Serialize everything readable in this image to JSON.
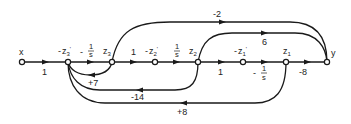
{
  "diagram": {
    "type": "signal-flow-graph",
    "nodes": [
      {
        "id": "x",
        "label": "x",
        "cx": 22,
        "cy": 62
      },
      {
        "id": "n_z3p",
        "label": "-z3'",
        "cx": 68,
        "cy": 62
      },
      {
        "id": "n_z3",
        "label": "z3",
        "cx": 112,
        "cy": 62
      },
      {
        "id": "n_z2p",
        "label": "-z2'",
        "cx": 155,
        "cy": 62
      },
      {
        "id": "n_z2",
        "label": "z2",
        "cx": 198,
        "cy": 62
      },
      {
        "id": "n_z1p",
        "label": "-z1'",
        "cx": 243,
        "cy": 62
      },
      {
        "id": "n_z1",
        "label": "z1",
        "cx": 286,
        "cy": 62
      },
      {
        "id": "y",
        "label": "y",
        "cx": 327,
        "cy": 62
      }
    ],
    "node_labels": {
      "x": "x",
      "z3p_minus": "-",
      "z3p": "z",
      "z3p_sub": "3",
      "z3p_prime": "'",
      "z3": "z",
      "z3_sub": "3",
      "z2p_minus": "-",
      "z2p": "z",
      "z2p_sub": "2",
      "z2p_prime": "'",
      "z2": "z",
      "z2_sub": "2",
      "z1p_minus": "-",
      "z1p": "z",
      "z1p_sub": "1",
      "z1p_prime": "'",
      "z1": "z",
      "z1_sub": "1",
      "y": "y"
    },
    "edges": [
      {
        "from": "x",
        "to": "-z3'",
        "gain": "1"
      },
      {
        "from": "-z3'",
        "to": "z3",
        "gain": "-1/s"
      },
      {
        "from": "z3",
        "to": "-z2'",
        "gain": "1"
      },
      {
        "from": "-z2'",
        "to": "z2",
        "gain": "1/s"
      },
      {
        "from": "z2",
        "to": "-z1'",
        "gain": "1"
      },
      {
        "from": "-z1'",
        "to": "z1",
        "gain": "-1/s"
      },
      {
        "from": "z1",
        "to": "y",
        "gain": "-8"
      },
      {
        "from": "z3",
        "to": "y",
        "gain": "-2"
      },
      {
        "from": "z2",
        "to": "y",
        "gain": "6"
      },
      {
        "from": "z3",
        "to": "-z3'",
        "gain": "+7"
      },
      {
        "from": "z2",
        "to": "-z3'",
        "gain": "-14"
      },
      {
        "from": "z1",
        "to": "-z3'",
        "gain": "+8"
      }
    ],
    "gain_labels": {
      "x_to_z3p": "1",
      "z3p_to_z3_sign": "-",
      "z3p_to_z3_num": "1",
      "z3p_to_z3_den": "s",
      "z3_to_z2p": "1",
      "z2p_to_z2_num": "1",
      "z2p_to_z2_den": "s",
      "z2_to_z1p": "1",
      "z1p_to_z1_sign": "-",
      "z1p_to_z1_num": "1",
      "z1p_to_z1_den": "s",
      "z1_to_y": "-8",
      "z3_to_y": "-2",
      "z2_to_y": "6",
      "fb_z3": "+7",
      "fb_z2": "-14",
      "fb_z1": "+8"
    }
  }
}
